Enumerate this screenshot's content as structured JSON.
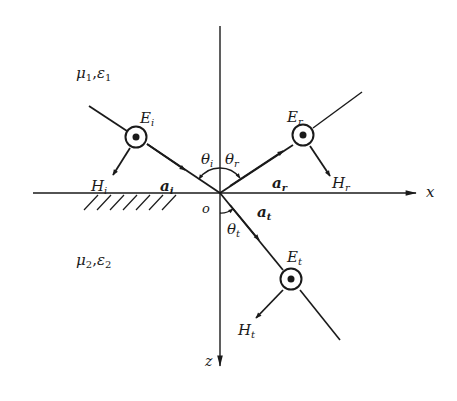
{
  "diagram": {
    "type": "oblique incidence of plane wave (perpendicular polarization)",
    "colors": {
      "ink": "#1a1a1a",
      "background": "#ffffff"
    },
    "media": {
      "upper": {
        "label_mu": "μ",
        "sub_mu": "1",
        "label_eps": "ε",
        "sub_eps": "1"
      },
      "lower": {
        "label_mu": "μ",
        "sub_mu": "2",
        "label_eps": "ε",
        "sub_eps": "2"
      }
    },
    "axes": {
      "x_label": "x",
      "z_label": "z",
      "origin_label": "o"
    },
    "incident": {
      "E": "E",
      "E_sub": "i",
      "H": "H",
      "H_sub": "i",
      "a": "a",
      "a_sub": "i",
      "theta": "θ",
      "theta_sub": "i"
    },
    "reflected": {
      "E": "E",
      "E_sub": "r",
      "H": "H",
      "H_sub": "r",
      "a": "a",
      "a_sub": "r",
      "theta": "θ",
      "theta_sub": "r"
    },
    "transmitted": {
      "E": "E",
      "E_sub": "t",
      "H": "H",
      "H_sub": "t",
      "a": "a",
      "a_sub": "t",
      "theta": "θ",
      "theta_sub": "t"
    }
  }
}
